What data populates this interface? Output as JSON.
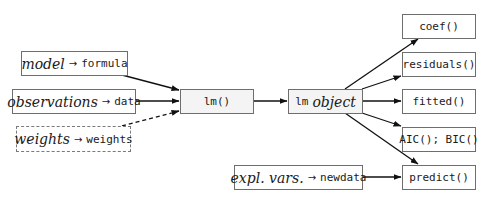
{
  "inputs": {
    "model": {
      "concept": "model",
      "arrow": "→",
      "arg": "formula"
    },
    "observations": {
      "concept": "observations",
      "arrow": "→",
      "arg": "data"
    },
    "weights": {
      "concept": "weights",
      "arrow": "→",
      "arg": "weights",
      "optional": true
    }
  },
  "center": {
    "function": "lm()",
    "object_prefix": "lm",
    "object_suffix": "object"
  },
  "newdata_input": {
    "concept": "expl. vars.",
    "arrow": "→",
    "arg": "newdata"
  },
  "extractors": [
    {
      "label": "coef()"
    },
    {
      "label": "residuals()"
    },
    {
      "label": "fitted()"
    },
    {
      "label": "AIC(); BIC()"
    },
    {
      "label": "predict()"
    }
  ],
  "colors": {
    "border": "#6e6e6e",
    "shaded_fill": "#f4f4f4",
    "line": "#111111"
  }
}
